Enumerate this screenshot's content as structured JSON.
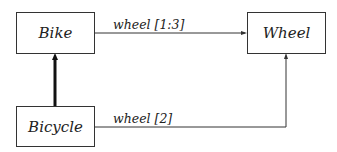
{
  "diagram": {
    "type": "class-diagram",
    "nodes": [
      {
        "id": "bike",
        "label": "Bike"
      },
      {
        "id": "wheel",
        "label": "Wheel"
      },
      {
        "id": "bicycle",
        "label": "Bicycle"
      }
    ],
    "edges": [
      {
        "from": "bike",
        "to": "wheel",
        "label": "wheel [1:3]",
        "kind": "association"
      },
      {
        "from": "bicycle",
        "to": "bike",
        "label": "",
        "kind": "inheritance"
      },
      {
        "from": "bicycle",
        "to": "wheel",
        "label": "wheel [2]",
        "kind": "association"
      }
    ]
  },
  "colors": {
    "line": "#333333",
    "text": "#222222",
    "background": "#ffffff"
  }
}
